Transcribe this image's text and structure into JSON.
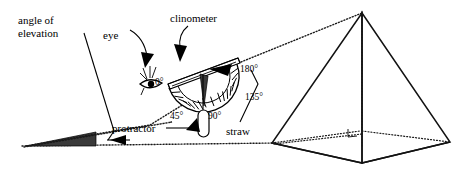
{
  "figure": {
    "background_color": "#ffffff",
    "ink_color": "#000000",
    "shade_color": "#3a3a3a"
  },
  "labels": {
    "angle_of_elevation_line1": "angle of",
    "angle_of_elevation_line2": "elevation",
    "eye": "eye",
    "clinometer": "clinometer",
    "protractor": "protractor",
    "straw": "straw",
    "deg_0": "0°",
    "deg_45": "45°",
    "deg_90": "90°",
    "deg_135": "135°",
    "deg_180": "180°"
  },
  "protractor_scale": {
    "marked_angles": [
      "0°",
      "45°",
      "90°",
      "135°",
      "180°"
    ],
    "span_degrees": 180,
    "tick_count": 19
  },
  "pyramid": {
    "name": "square-based pyramid",
    "apex_label": "",
    "right_angle_marker": true,
    "hidden_edges_dotted": true,
    "altitude_dotted": true
  },
  "ground": {
    "style": "dotted horizontal line"
  }
}
